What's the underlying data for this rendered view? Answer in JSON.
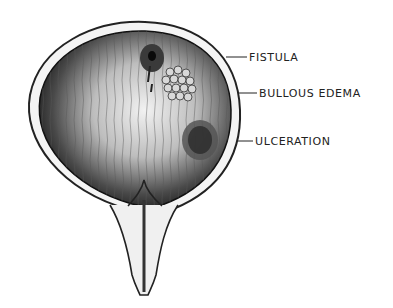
{
  "figure": {
    "labels": [
      {
        "text": "FISTULA",
        "x": 249,
        "y": 52
      },
      {
        "text": "BULLOUS EDEMA",
        "x": 259,
        "y": 88
      },
      {
        "text": "ULCERATION",
        "x": 255,
        "y": 136
      }
    ],
    "artist_signature": "Ruby"
  },
  "colors": {
    "background": "#ffffff",
    "ink": "#222222",
    "wall_dark": "#2a2a2a",
    "mucosa_light": "#e8e8e8"
  }
}
